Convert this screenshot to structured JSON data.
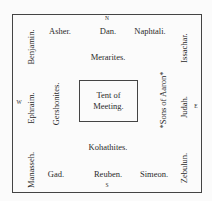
{
  "compass": {
    "north": "N",
    "south": "S",
    "west": "W",
    "east": "E"
  },
  "center": {
    "line1": "Tent of",
    "line2": "Meeting."
  },
  "north": {
    "tribes": [
      "Asher.",
      "Dan.",
      "Naphtali."
    ],
    "levites": "Merarites."
  },
  "south": {
    "tribes": [
      "Gad.",
      "Reuben.",
      "Simeon."
    ],
    "levites": "Kohathites."
  },
  "west": {
    "tribes": [
      "Benjamin.",
      "Ephraim.",
      "Manasseh."
    ],
    "levites": "Gershonites."
  },
  "east": {
    "tribes": [
      "Issachar.",
      "Judah.",
      "Zebulun."
    ],
    "levites": "*Sons of Aaron*"
  }
}
